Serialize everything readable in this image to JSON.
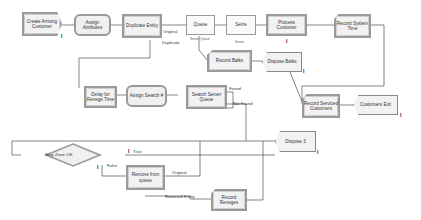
{
  "diagram": {
    "type": "process-flowchart",
    "modules": [
      {
        "id": "create",
        "label": "Create Arriving Customer",
        "shape": "create"
      },
      {
        "id": "assign_attr",
        "label": "Assign Attributes",
        "shape": "assign"
      },
      {
        "id": "duplicate",
        "label": "Duplicate Entity",
        "shape": "separate"
      },
      {
        "id": "queue",
        "label": "Queue",
        "shape": "rect",
        "sublabel": "Server Queue"
      },
      {
        "id": "seize",
        "label": "Seize",
        "shape": "rect",
        "sublabel": "Server"
      },
      {
        "id": "process",
        "label": "Process Customer",
        "shape": "process"
      },
      {
        "id": "record_time",
        "label": "Record System Time",
        "shape": "record"
      },
      {
        "id": "record_balks",
        "label": "Record Balks",
        "shape": "record"
      },
      {
        "id": "dispose_balks",
        "label": "Dispose Balks",
        "shape": "dispose"
      },
      {
        "id": "record_serviced",
        "label": "Record Serviced Customers",
        "shape": "record"
      },
      {
        "id": "customers_exit",
        "label": "Customers Exit",
        "shape": "dispose"
      },
      {
        "id": "delay_renege",
        "label": "Delay for Renege Time",
        "shape": "process"
      },
      {
        "id": "assign_search",
        "label": "Assign Search #",
        "shape": "assign"
      },
      {
        "id": "search_queue",
        "label": "Search Server Queue",
        "shape": "process"
      },
      {
        "id": "stay_zone",
        "label": "Stay Zone OK",
        "shape": "decide"
      },
      {
        "id": "dispose3",
        "label": "Dispose 3",
        "shape": "dispose"
      },
      {
        "id": "remove_queue",
        "label": "Remove from queue",
        "shape": "process"
      },
      {
        "id": "record_reneges",
        "label": "Record Reneges",
        "shape": "record"
      }
    ],
    "connector_labels": {
      "original": "Original",
      "duplicate": "Duplicate",
      "found": "Found",
      "not_found": "Not Found",
      "true": "True",
      "false": "False",
      "original2": "Original",
      "removed_entity": "Removed Entity"
    },
    "marker": "I"
  }
}
